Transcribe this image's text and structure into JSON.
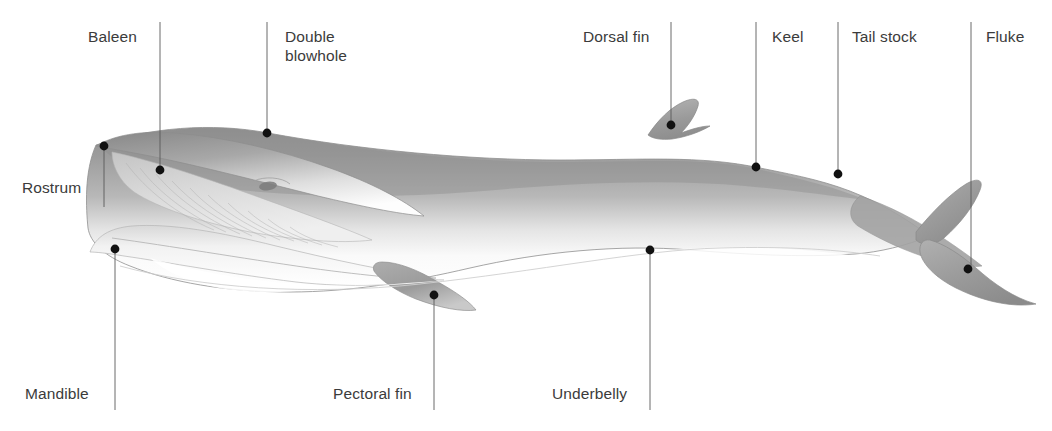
{
  "figure": {
    "background_color": "#ffffff",
    "label_color": "#3b3b3b",
    "leader_line_color": "#5a5a5a",
    "marker_color": "#111111",
    "body_top_color": "#9a9a9a",
    "body_belly_color": "#ffffff",
    "body_outline_color": "#8d8d8d"
  },
  "callouts": [
    {
      "id": "baleen",
      "label": "Baleen",
      "lines": [
        "Baleen"
      ],
      "label_x": 88,
      "label_y": 27,
      "label_align": "left",
      "line_x": 160,
      "line_y1": 22,
      "line_y2": 170,
      "dot_x": 160,
      "dot_y": 170
    },
    {
      "id": "double-blowhole",
      "label": "Double blowhole",
      "lines": [
        "Double",
        "blowhole"
      ],
      "label_x": 285,
      "label_y": 27,
      "label_align": "left",
      "line_x": 267,
      "line_y1": 22,
      "line_y2": 133,
      "dot_x": 267,
      "dot_y": 133
    },
    {
      "id": "dorsal-fin",
      "label": "Dorsal fin",
      "lines": [
        "Dorsal fin"
      ],
      "label_x": 583,
      "label_y": 27,
      "label_align": "left",
      "line_x": 671,
      "line_y1": 22,
      "line_y2": 125,
      "dot_x": 671,
      "dot_y": 125
    },
    {
      "id": "keel",
      "label": "Keel",
      "lines": [
        "Keel"
      ],
      "label_x": 772,
      "label_y": 27,
      "label_align": "left",
      "line_x": 756,
      "line_y1": 22,
      "line_y2": 167,
      "dot_x": 756,
      "dot_y": 167
    },
    {
      "id": "tail-stock",
      "label": "Tail stock",
      "lines": [
        "Tail stock"
      ],
      "label_x": 852,
      "label_y": 27,
      "label_align": "left",
      "line_x": 838,
      "line_y1": 22,
      "line_y2": 174,
      "dot_x": 838,
      "dot_y": 174
    },
    {
      "id": "fluke",
      "label": "Fluke",
      "lines": [
        "Fluke"
      ],
      "label_x": 986,
      "label_y": 27,
      "label_align": "left",
      "line_x": 971,
      "line_y1": 22,
      "line_y2": 269,
      "dot_x": 968,
      "dot_y": 269
    },
    {
      "id": "rostrum",
      "label": "Rostrum",
      "lines": [
        "Rostrum"
      ],
      "label_x": 22,
      "label_y": 178,
      "label_align": "left",
      "line_x": 104,
      "line_y1": 146,
      "line_y2": 207,
      "dot_x": 104,
      "dot_y": 146
    },
    {
      "id": "mandible",
      "label": "Mandible",
      "lines": [
        "Mandible"
      ],
      "label_x": 25,
      "label_y": 384,
      "label_align": "left",
      "line_x": 115,
      "line_y1": 249,
      "line_y2": 410,
      "dot_x": 115,
      "dot_y": 249
    },
    {
      "id": "pectoral-fin",
      "label": "Pectoral fin",
      "lines": [
        "Pectoral fin"
      ],
      "label_x": 333,
      "label_y": 384,
      "label_align": "left",
      "line_x": 434,
      "line_y1": 295,
      "line_y2": 410,
      "dot_x": 434,
      "dot_y": 295
    },
    {
      "id": "underbelly",
      "label": "Underbelly",
      "lines": [
        "Underbelly"
      ],
      "label_x": 552,
      "label_y": 384,
      "label_align": "left",
      "line_x": 650,
      "line_y1": 250,
      "line_y2": 410,
      "dot_x": 650,
      "dot_y": 250
    }
  ]
}
